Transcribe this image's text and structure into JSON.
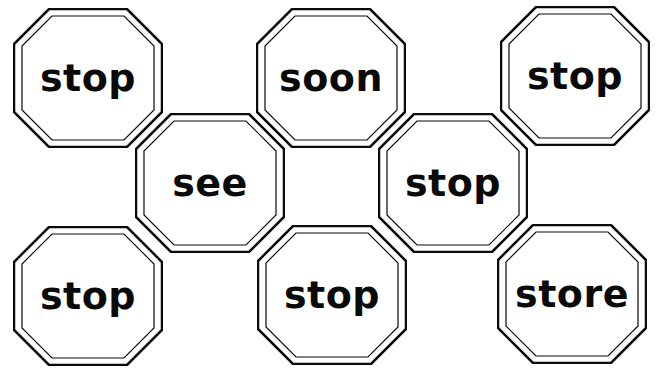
{
  "signs": [
    {
      "word": "stop"
    },
    {
      "word": "soon"
    },
    {
      "word": "stop"
    },
    {
      "word": "see"
    },
    {
      "word": "stop"
    },
    {
      "word": "stop"
    },
    {
      "word": "stop"
    },
    {
      "word": "store"
    }
  ],
  "colors": {
    "stroke": "#0a0a0a",
    "fill": "#ffffff"
  }
}
